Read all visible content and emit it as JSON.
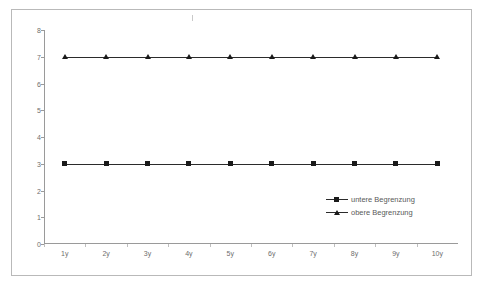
{
  "chart_data": {
    "type": "line",
    "title": "",
    "xlabel": "",
    "ylabel": "",
    "categories": [
      "1y",
      "2y",
      "3y",
      "4y",
      "5y",
      "6y",
      "7y",
      "8y",
      "9y",
      "10y"
    ],
    "series": [
      {
        "name": "untere Begrenzung",
        "marker": "square",
        "values": [
          3,
          3,
          3,
          3,
          3,
          3,
          3,
          3,
          3,
          3
        ]
      },
      {
        "name": "obere Begrenzung",
        "marker": "triangle",
        "values": [
          7,
          7,
          7,
          7,
          7,
          7,
          7,
          7,
          7,
          7
        ]
      }
    ],
    "ylim": [
      0,
      8
    ],
    "y_ticks": [
      0,
      1,
      2,
      3,
      4,
      5,
      6,
      7,
      8
    ],
    "y_tick_labels": [
      "0",
      "1",
      "2",
      "3",
      "4",
      "5",
      "6",
      "7",
      "8"
    ],
    "grid": false,
    "legend_position": "inside-right",
    "line_color": "#2b2b2b",
    "marker_color": "#1a1a1a",
    "axis_color": "#9a9a9a",
    "frame_color": "#b9b9b9"
  },
  "legend": {
    "entries": [
      {
        "label": "untere Begrenzung"
      },
      {
        "label": "obere Begrenzung"
      }
    ]
  },
  "caption": {
    "text": ""
  }
}
